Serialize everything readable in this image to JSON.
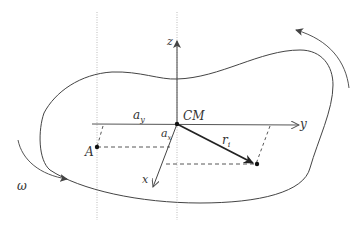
{
  "diagram": {
    "labels": {
      "z_axis": "z",
      "y_axis": "y",
      "x_axis": "x",
      "cm": "CM",
      "a_y": "a",
      "a_y_sub": "y",
      "a_x": "a",
      "a_x_sub": "x",
      "point_a": "A",
      "r_i": "r",
      "r_i_sub": "i",
      "omega": "ω"
    },
    "colors": {
      "line": "#444444",
      "dotted": "#aaaaaa",
      "text": "#333333",
      "background": "#ffffff"
    }
  }
}
